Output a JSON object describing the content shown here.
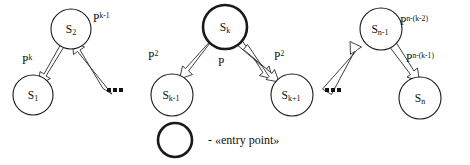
{
  "diagram": {
    "nodes": [
      {
        "id": "s1",
        "label": "S",
        "sub": "1",
        "cx": 33,
        "cy": 95,
        "r": 20,
        "bold": false,
        "name": "node-s1"
      },
      {
        "id": "s2",
        "label": "S",
        "sub": "2",
        "cx": 71,
        "cy": 29,
        "r": 20,
        "bold": false,
        "name": "node-s2"
      },
      {
        "id": "skm1",
        "label": "S",
        "sub": "k-1",
        "cx": 172,
        "cy": 95,
        "r": 21,
        "bold": false,
        "name": "node-sk-minus-1"
      },
      {
        "id": "sk",
        "label": "S",
        "sub": "k",
        "cx": 225,
        "cy": 27,
        "r": 22,
        "bold": true,
        "name": "node-sk"
      },
      {
        "id": "skp1",
        "label": "S",
        "sub": "k+1",
        "cx": 292,
        "cy": 95,
        "r": 21,
        "bold": false,
        "name": "node-sk-plus-1"
      },
      {
        "id": "snm1",
        "label": "S",
        "sub": "n-1",
        "cx": 381,
        "cy": 29,
        "r": 21,
        "bold": false,
        "name": "node-sn-minus-1"
      },
      {
        "id": "sn",
        "label": "S",
        "sub": "n",
        "cx": 420,
        "cy": 98,
        "r": 21,
        "bold": false,
        "name": "node-sn"
      }
    ],
    "edges": [
      {
        "id": "e1",
        "from": "s2",
        "to": "s1",
        "label": "P",
        "sup": "k",
        "name": "edge-s2-to-s1"
      },
      {
        "id": "e2",
        "from": "s1",
        "to": "s2",
        "label": "P",
        "sup": "k-1",
        "name": "edge-s1-to-s2"
      },
      {
        "id": "e3",
        "from": "sk",
        "to": "skm1",
        "label": "P",
        "sup": "2",
        "name": "edge-sk-to-sk-minus-1"
      },
      {
        "id": "e4",
        "from": "sk",
        "to": "skp1",
        "label": "P",
        "sup": "",
        "name": "edge-sk-to-sk-plus-1"
      },
      {
        "id": "e5",
        "from": "skp1",
        "to": "sk",
        "label": "P",
        "sup": "2",
        "name": "edge-sk-plus-1-to-sk"
      },
      {
        "id": "e6",
        "from": "snm1",
        "to": "sn",
        "label": "P",
        "sup": "n-(k-2)",
        "name": "edge-sn-minus-1-to-sn"
      },
      {
        "id": "e7",
        "from": "sn",
        "to": "snm1",
        "label": "P",
        "sup": "n-(k-1)",
        "name": "edge-sn-to-sn-minus-1"
      }
    ],
    "edge_labels": [
      {
        "id": "lbl_pk",
        "base": "P",
        "sup": "k",
        "x": 22,
        "y": 64,
        "name": "edge-label-p-k"
      },
      {
        "id": "lbl_pkm1",
        "base": "P",
        "sup": "k-1",
        "x": 93,
        "y": 22,
        "name": "edge-label-p-k-minus-1"
      },
      {
        "id": "lbl_p2a",
        "base": "P",
        "sup": "2",
        "x": 148,
        "y": 60,
        "name": "edge-label-p-squared-left"
      },
      {
        "id": "lbl_p",
        "base": "P",
        "sup": "",
        "x": 218,
        "y": 66,
        "name": "edge-label-p"
      },
      {
        "id": "lbl_p2b",
        "base": "P",
        "sup": "2",
        "x": 274,
        "y": 60,
        "name": "edge-label-p-squared-right"
      },
      {
        "id": "lbl_pnk2",
        "base": "P",
        "sup": "n-(k-2)",
        "x": 400,
        "y": 25,
        "name": "edge-label-p-n-k-2"
      },
      {
        "id": "lbl_pnk1",
        "base": "P",
        "sup": "n-(k-1)",
        "x": 406,
        "y": 62,
        "name": "edge-label-p-n-k-1"
      }
    ],
    "ellipses": [
      {
        "id": "ell_left",
        "x": 112,
        "y": 91,
        "name": "ellipsis-left"
      },
      {
        "id": "ell_right",
        "x": 330,
        "y": 91,
        "name": "ellipsis-right"
      }
    ],
    "legend": {
      "marker_cx": 175,
      "marker_cy": 140,
      "marker_r": 17,
      "text": "- «entry point»",
      "text_x": 208,
      "text_y": 141
    },
    "colors": {
      "stroke": "#1a1a1a",
      "fill": "#ffffff",
      "text": "#101010"
    }
  }
}
